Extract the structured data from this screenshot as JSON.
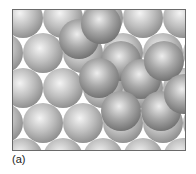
{
  "figure": {
    "caption": "(a)",
    "colors": {
      "background": "#ffffff",
      "frame": "#6a6a6a",
      "bottom_layer_highlight": "#f4f4f4",
      "bottom_layer_mid": "#bdbdbd",
      "bottom_layer_shadow": "#8c8c8c",
      "top_layer_highlight": "#ededed",
      "top_layer_mid": "#a8a8a8",
      "top_layer_shadow": "#6e6e6e"
    },
    "sphere_radius": 20,
    "layers": [
      {
        "name": "bottom",
        "spheres": [
          [
            10,
            8
          ],
          [
            50,
            8
          ],
          [
            90,
            8
          ],
          [
            130,
            8
          ],
          [
            170,
            8
          ],
          [
            -10,
            43
          ],
          [
            30,
            43
          ],
          [
            70,
            43
          ],
          [
            110,
            43
          ],
          [
            150,
            43
          ],
          [
            190,
            43
          ],
          [
            10,
            78
          ],
          [
            50,
            78
          ],
          [
            90,
            78
          ],
          [
            130,
            78
          ],
          [
            170,
            78
          ],
          [
            -10,
            113
          ],
          [
            30,
            113
          ],
          [
            70,
            113
          ],
          [
            110,
            113
          ],
          [
            150,
            113
          ],
          [
            190,
            113
          ],
          [
            10,
            148
          ],
          [
            50,
            148
          ],
          [
            90,
            148
          ],
          [
            130,
            148
          ],
          [
            170,
            148
          ]
        ]
      },
      {
        "name": "top",
        "spheres": [
          [
            66,
            29
          ],
          [
            88,
            14
          ],
          [
            108,
            51
          ],
          [
            86,
            68
          ],
          [
            128,
            69
          ],
          [
            151,
            51
          ],
          [
            108,
            101
          ],
          [
            148,
            101
          ],
          [
            171,
            84
          ]
        ]
      }
    ]
  }
}
